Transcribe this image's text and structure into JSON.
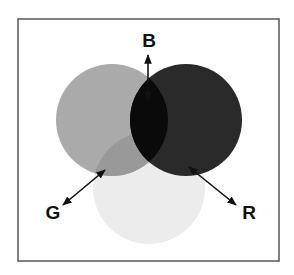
{
  "diagram": {
    "type": "venn-color-mixing",
    "frame": {
      "x": 18,
      "y": 19,
      "width": 261,
      "height": 242,
      "stroke": "#555555"
    },
    "circles": [
      {
        "id": "G",
        "label": "G",
        "cx": 112,
        "cy": 120,
        "r": 56,
        "color": "#aaaaaa"
      },
      {
        "id": "B",
        "label": "B",
        "cx": 186,
        "cy": 120,
        "r": 56,
        "color": "#2a2a2a"
      },
      {
        "id": "R",
        "label": "R",
        "cx": 149,
        "cy": 188,
        "r": 56,
        "color": "#ececec"
      }
    ],
    "overlaps": {
      "green_blue": "#0a0a0a",
      "green_light": "#999999",
      "blue_light": "#2a2a2a"
    },
    "labels": [
      {
        "text": "B",
        "x": 149,
        "y": 47
      },
      {
        "text": "G",
        "x": 53,
        "y": 219
      },
      {
        "text": "R",
        "x": 249,
        "y": 219
      }
    ],
    "arrows": [
      {
        "name": "b-arrow",
        "x1": 148,
        "y1": 100,
        "x2": 148,
        "y2": 55
      },
      {
        "name": "g-arrow",
        "x1": 105,
        "y1": 170,
        "x2": 63,
        "y2": 205
      },
      {
        "name": "r-arrow",
        "x1": 189,
        "y1": 167,
        "x2": 236,
        "y2": 205
      }
    ]
  }
}
